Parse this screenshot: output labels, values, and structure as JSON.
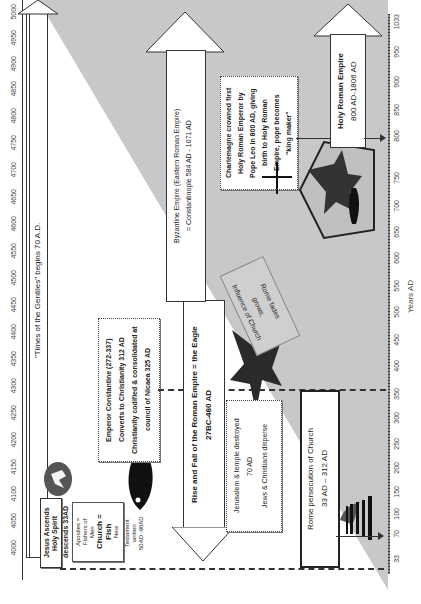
{
  "top_axis": {
    "label": "Years of Time from Adam",
    "ticks": [
      "4000",
      "4050",
      "4100",
      "4150",
      "4200",
      "4250",
      "4300",
      "4350",
      "4400",
      "4450",
      "4500",
      "4550",
      "4600",
      "4650",
      "4700",
      "4750",
      "4800",
      "4850",
      "4900",
      "4950",
      "5000"
    ]
  },
  "bottom_axis": {
    "label": "Years AD",
    "ticks": [
      "33",
      "70",
      "100",
      "150",
      "200",
      "250",
      "300",
      "350",
      "400",
      "450",
      "500",
      "550",
      "600",
      "650",
      "700",
      "750",
      "800",
      "850",
      "900",
      "950",
      "1033"
    ]
  },
  "colors": {
    "shade": "#c8c8c8",
    "dark": "#2a2a2a",
    "background": "#ffffff"
  },
  "gentiles": {
    "text": "\"Times of the Gentiles\" begins 70 A.D."
  },
  "jesus_box": {
    "line1": "Jesus Ascends",
    "line2": "Holy Spirit",
    "line3": "descends  33AD"
  },
  "church_box": {
    "line1": "Apostles =",
    "line2": "Fishers of",
    "line3": "Men",
    "line4": "Church =",
    "line5": "Fish",
    "line6": "New",
    "line7": "Testament",
    "line8": "written",
    "line9": "50AD -90AD"
  },
  "constantine_box": {
    "line1": "Emperor Constantine (272-337)",
    "line2": "Converts to Christianity 312 AD",
    "line3": "Christianity codified & consolidated at",
    "line4": "council of Nicaea 325 AD"
  },
  "roman_empire_arrow": {
    "line1": "Rise and Fall of the Roman Empire = the Eagle",
    "line2": "27BC-480 AD"
  },
  "jerusalem_box": {
    "line1": "Jerusalem & temple destroyed",
    "line2": "70 AD",
    "line3": "Jews & Christians disperse"
  },
  "persecution_box": {
    "line1": "Rome persecution of Church",
    "line2": "33 AD – 312 AD"
  },
  "influence_note": {
    "line1": "Influence of Church",
    "line2": "grows,",
    "line3": "Rome fades"
  },
  "byzantine_arrow": {
    "line1": "Byzantine Empire (Eastern Roman Empire)",
    "line2": "= Constantinople 584 AD - 1071 AD"
  },
  "charlemagne_box": {
    "line1": "Charlemagne crowned first",
    "line2": "Holy Roman Emperor by",
    "line3": "Pope Leo in 800 AD, giving",
    "line4": "birth to Holy Roman",
    "line5": "Empire, pope becomes",
    "line6": "\"king maker\""
  },
  "holy_roman_arrow": {
    "line1": "Holy Roman Empire",
    "line2": "800 AD-1806 AD"
  },
  "icons": {
    "dove": "dove-icon",
    "fish": "fish-icon",
    "eagle": "eagle-icon",
    "temple": "temple-icon",
    "cross": "cross-icon",
    "shield": "shield-emblem-icon"
  }
}
